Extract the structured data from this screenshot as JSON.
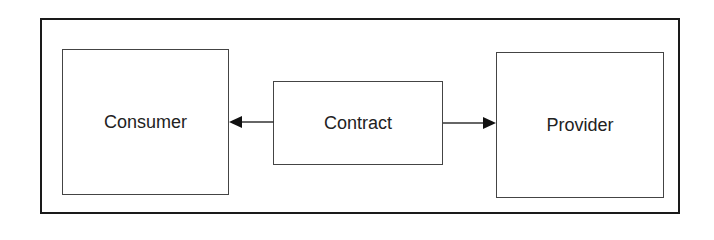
{
  "diagram": {
    "nodes": [
      {
        "id": "consumer",
        "label": "Consumer"
      },
      {
        "id": "contract",
        "label": "Contract"
      },
      {
        "id": "provider",
        "label": "Provider"
      }
    ],
    "edges": [
      {
        "from": "contract",
        "to": "consumer"
      },
      {
        "from": "contract",
        "to": "provider"
      }
    ]
  }
}
